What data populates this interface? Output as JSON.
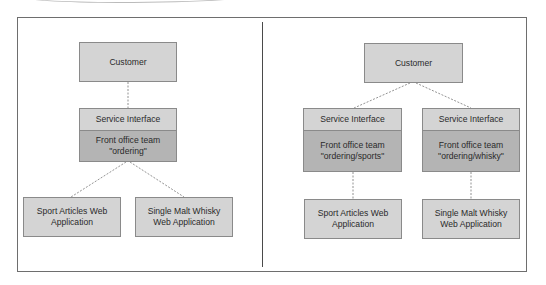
{
  "left_diagram": {
    "customer": "Customer",
    "service_interface": "Service Interface",
    "front_office": [
      "Front office team",
      "\"ordering\""
    ],
    "apps": [
      [
        "Sport Articles Web",
        "Application"
      ],
      [
        "Single Malt Whisky",
        "Web Application"
      ]
    ]
  },
  "right_diagram": {
    "customer": "Customer",
    "teams": [
      {
        "service_interface": "Service Interface",
        "front_office": [
          "Front office team",
          "\"ordering/sports\""
        ],
        "app": [
          "Sport Articles Web",
          "Application"
        ]
      },
      {
        "service_interface": "Service Interface",
        "front_office": [
          "Front office team",
          "\"ordering/whisky\""
        ],
        "app": [
          "Single Malt Whisky",
          "Web Application"
        ]
      }
    ]
  },
  "colors": {
    "box_light": "#d4d4d4",
    "box_dark": "#b4b4b4",
    "border": "#8a8a8a",
    "connector": "#777777"
  }
}
